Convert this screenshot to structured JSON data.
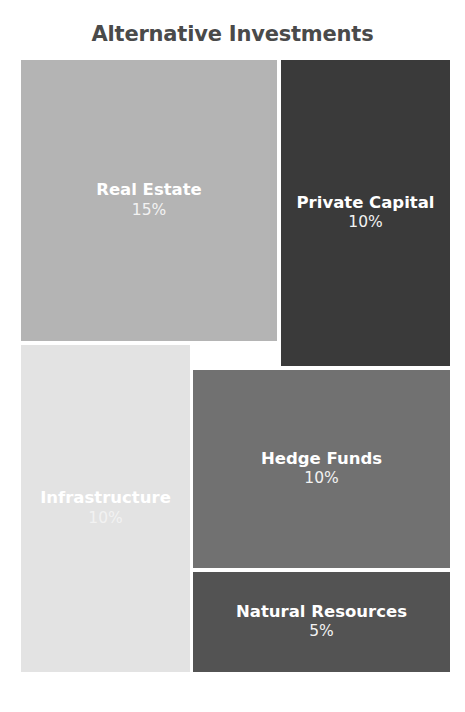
{
  "chart_data": {
    "type": "treemap",
    "title": "Alternative Investments",
    "xlabel": "",
    "ylabel": "",
    "legend": "none",
    "grid": false,
    "value_unit": "%",
    "total": 50,
    "categories": [
      "Real Estate",
      "Private Capital",
      "Infrastructure",
      "Hedge Funds",
      "Natural Resources"
    ],
    "values": [
      15,
      10,
      10,
      10,
      5
    ],
    "value_labels": [
      "15%",
      "10%",
      "10%",
      "10%",
      "5%"
    ],
    "colors": [
      "#b4b4b4",
      "#3a3a3a",
      "#e3e3e3",
      "#717171",
      "#535353"
    ],
    "tiles": [
      {
        "label": "Real Estate",
        "value": 15,
        "value_label": "15%",
        "color": "#b4b4b4"
      },
      {
        "label": "Private Capital",
        "value": 10,
        "value_label": "10%",
        "color": "#3a3a3a"
      },
      {
        "label": "Infrastructure",
        "value": 10,
        "value_label": "10%",
        "color": "#e3e3e3"
      },
      {
        "label": "Hedge Funds",
        "value": 10,
        "value_label": "10%",
        "color": "#717171"
      },
      {
        "label": "Natural Resources",
        "value": 5,
        "value_label": "5%",
        "color": "#535353"
      }
    ]
  },
  "style": {
    "background": "#ffffff",
    "title_color": "#4a4a4a",
    "label_color": "#ffffff",
    "value_color": "#f2f2f2"
  }
}
